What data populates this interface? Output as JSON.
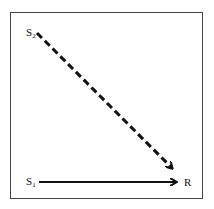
{
  "diagram": {
    "nodes": [
      {
        "id": "S2",
        "label": "S",
        "subscript": "2"
      },
      {
        "id": "S1",
        "label": "S",
        "subscript": "1"
      },
      {
        "id": "R",
        "label": "R"
      }
    ],
    "edges": [
      {
        "from": "S2",
        "to": "R",
        "style": "dashed"
      },
      {
        "from": "S1",
        "to": "R",
        "style": "solid"
      }
    ],
    "colors": {
      "line": "#111111",
      "frame": "#444444"
    }
  }
}
